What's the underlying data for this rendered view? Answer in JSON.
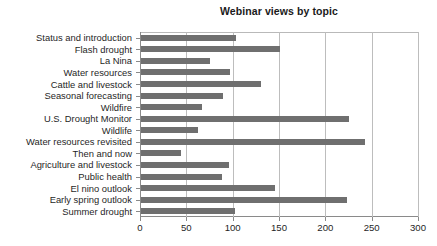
{
  "chart_data": {
    "type": "bar",
    "orientation": "horizontal",
    "title": "Webinar views by topic",
    "xlabel": "",
    "ylabel": "",
    "xlim": [
      0,
      300
    ],
    "xticks": [
      0,
      50,
      100,
      150,
      200,
      250,
      300
    ],
    "grid": true,
    "legend": false,
    "bar_color": "#6f6f6f",
    "categories": [
      "Status and introduction",
      "Flash drought",
      "La Nina",
      "Water resources",
      "Cattle and livestock",
      "Seasonal forecasting",
      "Wildfire",
      "U.S. Drought Monitor",
      "Wildlife",
      "Water resources revisited",
      "Then and now",
      "Agriculture and livestock",
      "Public health",
      "El nino outlook",
      "Early spring outlook",
      "Summer drought"
    ],
    "values": [
      102,
      150,
      74,
      96,
      129,
      88,
      66,
      224,
      62,
      242,
      43,
      95,
      87,
      145,
      222,
      101
    ]
  }
}
